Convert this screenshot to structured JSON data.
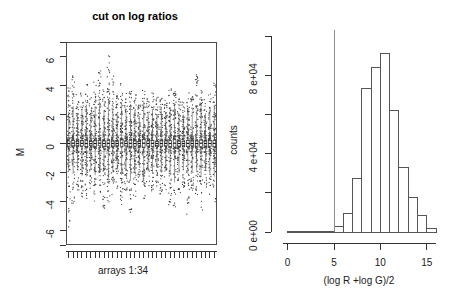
{
  "figure": {
    "background": "#ffffff",
    "axis_color": "#333333",
    "bar_edge_color": "#555555",
    "bar_fill_color": "#ffffff",
    "cut_line_color": "#8c8c8c",
    "point_color": "#3a3a3a"
  },
  "left_panel": {
    "title": "cut on log ratios",
    "ylabel": "M",
    "xlabel": "arrays 1:34",
    "y_ticks": [
      "6",
      "4",
      "2",
      "0",
      "-2",
      "-4",
      "-6"
    ],
    "n_arrays": 34
  },
  "right_panel": {
    "ylabel": "counts",
    "xlabel": "(log R +log G)/2",
    "y_ticks": [
      "0 e+00",
      "4 e+04",
      "8 e+04"
    ],
    "x_ticks": [
      "0",
      "5",
      "10",
      "15"
    ],
    "cut_value": 5
  },
  "chart_data": [
    {
      "type": "box",
      "title": "cut on log ratios",
      "xlabel": "arrays 1:34",
      "ylabel": "M",
      "ylim": [
        -7,
        7
      ],
      "xlim": [
        0.5,
        34.5
      ],
      "grid": false,
      "legend": "none",
      "ytick_values": [
        6,
        4,
        2,
        0,
        -2,
        -4,
        -6
      ],
      "ytick_labels": [
        "6",
        "4",
        "2",
        "0",
        "-2",
        "-4",
        "-6"
      ],
      "categories": [
        1,
        2,
        3,
        4,
        5,
        6,
        7,
        8,
        9,
        10,
        11,
        12,
        13,
        14,
        15,
        16,
        17,
        18,
        19,
        20,
        21,
        22,
        23,
        24,
        25,
        26,
        27,
        28,
        29,
        30,
        31,
        32,
        33,
        34
      ],
      "boxes": [
        {
          "x": 1,
          "median": 0.0,
          "q1": -0.18,
          "q3": 0.17,
          "whisker_low": -1.9,
          "whisker_high": 2.2,
          "outlier_low": -5.8,
          "outlier_high": 3.9
        },
        {
          "x": 2,
          "median": 0.02,
          "q1": -0.16,
          "q3": 0.2,
          "whisker_low": -2.1,
          "whisker_high": 2.6,
          "outlier_low": -4.4,
          "outlier_high": 4.9
        },
        {
          "x": 3,
          "median": 0.0,
          "q1": -0.14,
          "q3": 0.15,
          "whisker_low": -1.7,
          "whisker_high": 2.0,
          "outlier_low": -3.3,
          "outlier_high": 3.4
        },
        {
          "x": 4,
          "median": 0.01,
          "q1": -0.17,
          "q3": 0.18,
          "whisker_low": -2.0,
          "whisker_high": 2.4,
          "outlier_low": -3.9,
          "outlier_high": 3.6
        },
        {
          "x": 5,
          "median": 0.0,
          "q1": -0.2,
          "q3": 0.19,
          "whisker_low": -2.3,
          "whisker_high": 2.7,
          "outlier_low": -4.3,
          "outlier_high": 4.1
        },
        {
          "x": 6,
          "median": -0.01,
          "q1": -0.15,
          "q3": 0.14,
          "whisker_low": -1.8,
          "whisker_high": 2.1,
          "outlier_low": -3.1,
          "outlier_high": 3.2
        },
        {
          "x": 7,
          "median": 0.0,
          "q1": -0.19,
          "q3": 0.18,
          "whisker_low": -2.2,
          "whisker_high": 2.5,
          "outlier_low": -4.0,
          "outlier_high": 4.4
        },
        {
          "x": 8,
          "median": 0.02,
          "q1": -0.16,
          "q3": 0.21,
          "whisker_low": -2.0,
          "whisker_high": 2.9,
          "outlier_low": -3.5,
          "outlier_high": 5.2
        },
        {
          "x": 9,
          "median": 0.0,
          "q1": -0.18,
          "q3": 0.17,
          "whisker_low": -1.9,
          "whisker_high": 2.3,
          "outlier_low": -4.5,
          "outlier_high": 3.8
        },
        {
          "x": 10,
          "median": 0.01,
          "q1": -0.21,
          "q3": 0.22,
          "whisker_low": -2.4,
          "whisker_high": 3.0,
          "outlier_low": -4.1,
          "outlier_high": 6.1
        },
        {
          "x": 11,
          "median": 0.0,
          "q1": -0.17,
          "q3": 0.16,
          "whisker_low": -2.0,
          "whisker_high": 2.4,
          "outlier_low": -3.6,
          "outlier_high": 4.7
        },
        {
          "x": 12,
          "median": 0.0,
          "q1": -0.15,
          "q3": 0.15,
          "whisker_low": -1.8,
          "whisker_high": 2.1,
          "outlier_low": -3.2,
          "outlier_high": 3.3
        },
        {
          "x": 13,
          "median": 0.03,
          "q1": -0.19,
          "q3": 0.24,
          "whisker_low": -2.2,
          "whisker_high": 2.8,
          "outlier_low": -4.6,
          "outlier_high": 4.2
        },
        {
          "x": 14,
          "median": 0.0,
          "q1": -0.16,
          "q3": 0.16,
          "whisker_low": -1.9,
          "whisker_high": 2.2,
          "outlier_low": -3.4,
          "outlier_high": 3.5
        },
        {
          "x": 15,
          "median": 0.01,
          "q1": -0.22,
          "q3": 0.23,
          "whisker_low": -2.5,
          "whisker_high": 2.6,
          "outlier_low": -4.8,
          "outlier_high": 3.9
        },
        {
          "x": 16,
          "median": 0.0,
          "q1": -0.18,
          "q3": 0.17,
          "whisker_low": -2.0,
          "whisker_high": 2.3,
          "outlier_low": -3.7,
          "outlier_high": 3.4
        },
        {
          "x": 17,
          "median": 0.0,
          "q1": -0.14,
          "q3": 0.13,
          "whisker_low": -1.6,
          "whisker_high": 1.9,
          "outlier_low": -2.9,
          "outlier_high": 2.8
        },
        {
          "x": 18,
          "median": 0.02,
          "q1": -0.25,
          "q3": 0.27,
          "whisker_low": -2.6,
          "whisker_high": 2.9,
          "outlier_low": -4.2,
          "outlier_high": 3.7
        },
        {
          "x": 19,
          "median": 0.0,
          "q1": -0.17,
          "q3": 0.17,
          "whisker_low": -1.9,
          "whisker_high": 2.2,
          "outlier_low": -3.3,
          "outlier_high": 3.1
        },
        {
          "x": 20,
          "median": 0.01,
          "q1": -0.19,
          "q3": 0.2,
          "whisker_low": -2.1,
          "whisker_high": 2.4,
          "outlier_low": -3.8,
          "outlier_high": 3.6
        },
        {
          "x": 21,
          "median": 0.0,
          "q1": -0.15,
          "q3": 0.14,
          "whisker_low": -1.7,
          "whisker_high": 2.0,
          "outlier_low": -3.0,
          "outlier_high": 3.3
        },
        {
          "x": 22,
          "median": 0.0,
          "q1": -0.18,
          "q3": 0.18,
          "whisker_low": -2.0,
          "whisker_high": 2.3,
          "outlier_low": -3.5,
          "outlier_high": 3.5
        },
        {
          "x": 23,
          "median": 0.01,
          "q1": -0.16,
          "q3": 0.17,
          "whisker_low": -1.9,
          "whisker_high": 2.2,
          "outlier_low": -3.2,
          "outlier_high": 3.0
        },
        {
          "x": 24,
          "median": 0.0,
          "q1": -0.2,
          "q3": 0.19,
          "whisker_low": -2.2,
          "whisker_high": 2.5,
          "outlier_low": -4.3,
          "outlier_high": 3.8
        },
        {
          "x": 25,
          "median": 0.02,
          "q1": -0.24,
          "q3": 0.26,
          "whisker_low": -2.7,
          "whisker_high": 2.8,
          "outlier_low": -4.4,
          "outlier_high": 4.0
        },
        {
          "x": 26,
          "median": 0.0,
          "q1": -0.17,
          "q3": 0.16,
          "whisker_low": -1.9,
          "whisker_high": 2.1,
          "outlier_low": -3.4,
          "outlier_high": 3.2
        },
        {
          "x": 27,
          "median": 0.0,
          "q1": -0.15,
          "q3": 0.15,
          "whisker_low": -1.8,
          "whisker_high": 2.0,
          "outlier_low": -3.1,
          "outlier_high": 2.9
        },
        {
          "x": 28,
          "median": 0.01,
          "q1": -0.19,
          "q3": 0.2,
          "whisker_low": -2.1,
          "whisker_high": 2.4,
          "outlier_low": -5.0,
          "outlier_high": 3.6
        },
        {
          "x": 29,
          "median": 0.0,
          "q1": -0.16,
          "q3": 0.16,
          "whisker_low": -1.9,
          "whisker_high": 2.2,
          "outlier_low": -3.3,
          "outlier_high": 3.4
        },
        {
          "x": 30,
          "median": 0.0,
          "q1": -0.18,
          "q3": 0.17,
          "whisker_low": -2.0,
          "whisker_high": 2.3,
          "outlier_low": -3.6,
          "outlier_high": 4.8
        },
        {
          "x": 31,
          "median": 0.02,
          "q1": -0.21,
          "q3": 0.23,
          "whisker_low": -2.3,
          "whisker_high": 2.6,
          "outlier_low": -4.7,
          "outlier_high": 3.9
        },
        {
          "x": 32,
          "median": 0.0,
          "q1": -0.17,
          "q3": 0.16,
          "whisker_low": -1.9,
          "whisker_high": 2.1,
          "outlier_low": -3.2,
          "outlier_high": 3.1
        },
        {
          "x": 33,
          "median": 0.0,
          "q1": -0.19,
          "q3": 0.19,
          "whisker_low": -2.1,
          "whisker_high": 2.4,
          "outlier_low": -3.8,
          "outlier_high": 3.5
        },
        {
          "x": 34,
          "median": 0.01,
          "q1": -0.22,
          "q3": 0.21,
          "whisker_low": -2.3,
          "whisker_high": 2.7,
          "outlier_low": -4.1,
          "outlier_high": 4.3
        }
      ]
    },
    {
      "type": "bar",
      "subtype": "histogram",
      "title": "",
      "xlabel": "(log R +log G)/2",
      "ylabel": "counts",
      "xlim": [
        -0.5,
        16
      ],
      "ylim": [
        0,
        100000
      ],
      "grid": false,
      "legend": "none",
      "ytick_values": [
        0,
        40000,
        80000
      ],
      "ytick_labels": [
        "0 e+00",
        "4 e+04",
        "8 e+04"
      ],
      "ytick_minor_values": [
        20000,
        60000,
        100000
      ],
      "xtick_values": [
        0,
        5,
        10,
        15
      ],
      "xtick_labels": [
        "0",
        "5",
        "10",
        "15"
      ],
      "bin_width": 1,
      "bin_starts": [
        0,
        1,
        2,
        3,
        4,
        5,
        6,
        7,
        8,
        9,
        10,
        11,
        12,
        13,
        14,
        15
      ],
      "values": [
        120,
        110,
        130,
        150,
        180,
        2600,
        9500,
        27500,
        73000,
        84000,
        91000,
        62000,
        33000,
        17500,
        8500,
        1800
      ],
      "cut_line_x": 5,
      "annotations": [
        {
          "type": "vline",
          "x": 5,
          "label": "cut"
        }
      ]
    }
  ]
}
